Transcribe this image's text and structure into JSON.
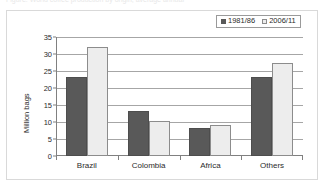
{
  "caption": {
    "text": "Figure: World coffee production by origin, average annual"
  },
  "chart_data": {
    "type": "bar",
    "title": "",
    "xlabel": "",
    "ylabel": "Million bags",
    "ylim": [
      0,
      35
    ],
    "yticks": [
      0,
      5,
      10,
      15,
      20,
      25,
      30,
      35
    ],
    "grid": true,
    "legend_position": "top-right",
    "categories": [
      "Brazil",
      "Colombia",
      "Africa",
      "Others"
    ],
    "series": [
      {
        "name": "1981/86",
        "color": "#595959",
        "marker": "filled-square",
        "values": [
          23.3,
          13.3,
          8.3,
          23.3
        ]
      },
      {
        "name": "2006/11",
        "color": "#ededed",
        "marker": "open-square",
        "values": [
          32.0,
          10.3,
          9.0,
          27.4
        ]
      }
    ]
  }
}
